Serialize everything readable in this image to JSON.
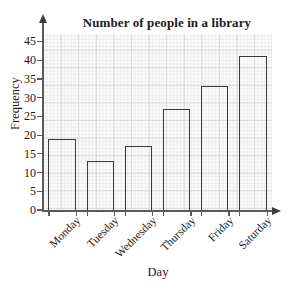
{
  "chart_data": {
    "type": "bar",
    "title": "Number of people in a library",
    "xlabel": "Day",
    "ylabel": "Frequency",
    "categories": [
      "Monday",
      "Tuesday",
      "Wednesday",
      "Thursday",
      "Friday",
      "Saturday"
    ],
    "values": [
      19,
      13,
      17,
      27,
      33,
      41
    ],
    "ylim": [
      0,
      47
    ],
    "yticks": [
      0,
      5,
      10,
      15,
      20,
      25,
      30,
      35,
      40,
      45
    ],
    "ytick_labels": [
      "0",
      "5",
      "10",
      "15",
      "20",
      "25",
      "30",
      "35",
      "40",
      "45"
    ],
    "grid": true,
    "grid_style": "graph-paper",
    "legend": false,
    "bar_fill": "#ffffff",
    "bar_edge_color": "#3a3a3a",
    "axis_color": "#5a5a5a",
    "grid_minor_color": "#ededed",
    "grid_major_color": "#d9d9d9",
    "background": "#fbfbfb",
    "x_label_rotation": -45,
    "axis_arrows": true
  }
}
